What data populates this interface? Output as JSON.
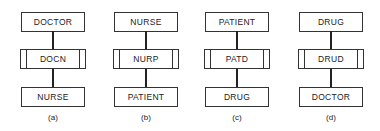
{
  "diagram": {
    "panels": [
      {
        "label": "(a)",
        "top": "DOCTOR",
        "link": "DOCN",
        "bottom": "NURSE",
        "x": 21
      },
      {
        "label": "(b)",
        "top": "NURSE",
        "link": "NURP",
        "bottom": "PATIENT",
        "x": 114
      },
      {
        "label": "(c)",
        "top": "PATIENT",
        "link": "PATD",
        "bottom": "DRUG",
        "x": 205
      },
      {
        "label": "(d)",
        "top": "DRUG",
        "link": "DRUD",
        "bottom": "DOCTOR",
        "x": 299
      }
    ],
    "colors": {
      "stroke": "#333333",
      "background": "#ffffff"
    }
  }
}
